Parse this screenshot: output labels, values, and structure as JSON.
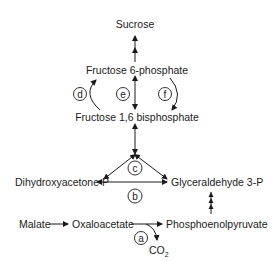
{
  "diagram": {
    "type": "metabolic-pathway",
    "nodes": {
      "sucrose": "Sucrose",
      "fructose_6_phosphate": "Fructose 6-phosphate",
      "fructose_16_bisphosphate": "Fructose 1,6 bisphosphate",
      "dihydroxyacetone_p": "Dihydroxyacetone P",
      "glyceraldehyde_3p": "Glyceraldehyde 3-P",
      "malate": "Malate",
      "oxaloacetate": "Oxaloacetate",
      "phosphoenolpyruvate": "Phosphoenolpyruvate",
      "co2": "CO",
      "co2_subscript": "2"
    },
    "reaction_labels": {
      "a": "a",
      "b": "b",
      "c": "c",
      "d": "d",
      "e": "e",
      "f": "f"
    },
    "edges": [
      {
        "from": "Fructose 6-phosphate",
        "to": "Sucrose",
        "style": "multi-step"
      },
      {
        "from": "Fructose 1,6 bisphosphate",
        "to": "Fructose 6-phosphate",
        "label": "d",
        "style": "curved"
      },
      {
        "from": "Fructose 6-phosphate",
        "to": "Fructose 1,6 bisphosphate",
        "label": "e",
        "style": "reversible"
      },
      {
        "from": "Fructose 6-phosphate",
        "to": "Fructose 1,6 bisphosphate",
        "label": "f",
        "style": "curved"
      },
      {
        "from": "Fructose 1,6 bisphosphate",
        "to": "Dihydroxyacetone P + Glyceraldehyde 3-P",
        "label": "c",
        "style": "reversible"
      },
      {
        "from": "Dihydroxyacetone P",
        "to": "Glyceraldehyde 3-P",
        "label": "b",
        "style": "reversible"
      },
      {
        "from": "Malate",
        "to": "Oxaloacetate"
      },
      {
        "from": "Oxaloacetate",
        "to": "Phosphoenolpyruvate",
        "label": "a",
        "byproduct": "CO2"
      },
      {
        "from": "Phosphoenolpyruvate",
        "to": "Glyceraldehyde 3-P",
        "style": "multi-step"
      }
    ]
  }
}
